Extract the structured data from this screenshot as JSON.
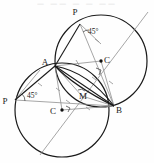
{
  "figure": {
    "type": "geometry-diagram",
    "top_text": "— —— — — ——",
    "width": 154,
    "height": 163,
    "colors": {
      "stroke_main": "#1a1a1a",
      "stroke_construction": "#8a8a8a",
      "background": "#fefefe",
      "label": "#1a1a1a"
    },
    "points": [
      {
        "id": "P_top",
        "label": "P",
        "x": 80,
        "y": 24,
        "label_x": 75,
        "label_y": 15,
        "dot": false
      },
      {
        "id": "A",
        "label": "A",
        "x": 55,
        "y": 66,
        "label_x": 45,
        "label_y": 65,
        "dot": false
      },
      {
        "id": "C_upper",
        "label": "C",
        "x": 101,
        "y": 61,
        "label_x": 105,
        "label_y": 62,
        "dot": true
      },
      {
        "id": "B",
        "label": "B",
        "x": 114,
        "y": 106,
        "label_x": 117,
        "label_y": 112,
        "dot": false
      },
      {
        "id": "M",
        "label": "M",
        "x": 82,
        "y": 96,
        "label_x": 82,
        "label_y": 99,
        "dot": false
      },
      {
        "id": "C_lower",
        "label": "C",
        "x": 62,
        "y": 110,
        "label_x": 53,
        "label_y": 113,
        "dot": true
      },
      {
        "id": "P_left",
        "label": "P",
        "x": 15,
        "y": 100,
        "label_x": 4,
        "label_y": 103,
        "dot": false
      }
    ],
    "angle_labels": [
      {
        "id": "angle_top",
        "text": "45°",
        "x": 88,
        "y": 34
      },
      {
        "id": "angle_left",
        "text": "45°",
        "x": 27,
        "y": 98
      }
    ],
    "circles": [
      {
        "id": "circle_upper_right",
        "cx": 101,
        "cy": 61,
        "r": 46
      },
      {
        "id": "circle_lower_left",
        "cx": 62,
        "cy": 110,
        "r": 47
      }
    ],
    "tick_marks_count": 8
  }
}
